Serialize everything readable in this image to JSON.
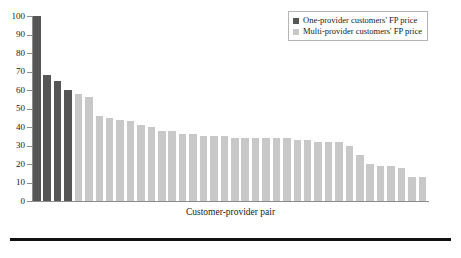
{
  "chart_data": {
    "type": "bar",
    "title": "",
    "subtitle": "",
    "xlabel": "Customer-provider pair",
    "ylabel": "",
    "ylim": [
      0,
      100
    ],
    "yticks": [
      0,
      10,
      20,
      30,
      40,
      50,
      60,
      70,
      80,
      90,
      100
    ],
    "ytick_labels": [
      "0",
      "10",
      "20",
      "30",
      "40",
      "50",
      "60",
      "70",
      "80",
      "90",
      "100"
    ],
    "grid": false,
    "legend_position": "top-right",
    "categories": [
      "1",
      "2",
      "3",
      "4",
      "5",
      "6",
      "7",
      "8",
      "9",
      "10",
      "11",
      "12",
      "13",
      "14",
      "15",
      "16",
      "17",
      "18",
      "19",
      "20",
      "21",
      "22",
      "23",
      "24",
      "25",
      "26",
      "27",
      "28",
      "29",
      "30",
      "31",
      "32",
      "33",
      "34",
      "35",
      "36",
      "37",
      "38"
    ],
    "values": [
      100,
      68,
      65,
      60,
      58,
      56,
      46,
      45,
      44,
      43,
      41,
      40,
      38,
      38,
      36,
      36,
      35,
      35,
      35,
      34,
      34,
      34,
      34,
      34,
      34,
      33,
      33,
      32,
      32,
      32,
      30,
      25,
      20,
      19,
      19,
      18,
      13,
      13
    ],
    "bar_groups": [
      "one-provider",
      "one-provider",
      "one-provider",
      "one-provider",
      "multi-provider",
      "multi-provider",
      "multi-provider",
      "multi-provider",
      "multi-provider",
      "multi-provider",
      "multi-provider",
      "multi-provider",
      "multi-provider",
      "multi-provider",
      "multi-provider",
      "multi-provider",
      "multi-provider",
      "multi-provider",
      "multi-provider",
      "multi-provider",
      "multi-provider",
      "multi-provider",
      "multi-provider",
      "multi-provider",
      "multi-provider",
      "multi-provider",
      "multi-provider",
      "multi-provider",
      "multi-provider",
      "multi-provider",
      "multi-provider",
      "multi-provider",
      "multi-provider",
      "multi-provider",
      "multi-provider",
      "multi-provider",
      "multi-provider",
      "multi-provider"
    ],
    "series": [
      {
        "name": "One-provider customers' FP price",
        "color": "#565656"
      },
      {
        "name": "Multi-provider customers' FP price",
        "color": "#c8c8c8"
      }
    ]
  },
  "legend": {
    "items": [
      {
        "label": "One-provider customers' FP price",
        "color": "#565656",
        "key": "one-provider"
      },
      {
        "label": "Multi-provider customers' FP price",
        "color": "#c8c8c8",
        "key": "multi-provider"
      }
    ]
  },
  "axis": {
    "x_title": "Customer-provider pair"
  },
  "colors": {
    "one_provider": "#565656",
    "multi_provider": "#c8c8c8",
    "axis": "#8c8c8c",
    "rule": "#111111",
    "background": "#ffffff"
  }
}
